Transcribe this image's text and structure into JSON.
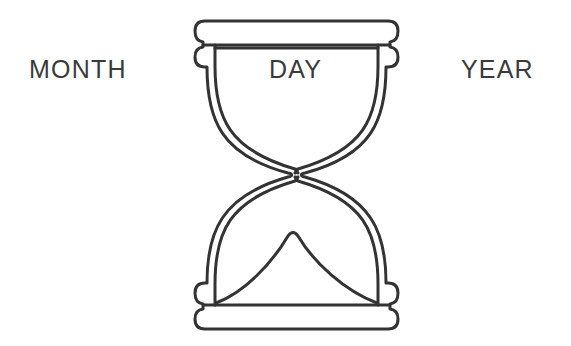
{
  "canvas": {
    "width": 571,
    "height": 346,
    "background_color": "#ffffff"
  },
  "illustration": {
    "name": "hourglass-line-drawing",
    "stroke_color": "#333333",
    "fill_color": "#ffffff",
    "stroke_width": 3
  },
  "labels": {
    "month": "MONTH",
    "day": "DAY",
    "year": "YEAR",
    "text_color": "#3a3a3a",
    "font_size": "25px"
  },
  "parts": {
    "top_cap": "top-cap-bar",
    "top_bulb": "upper-glass-bulb",
    "waist": "hourglass-waist",
    "bottom_bulb": "lower-glass-bulb",
    "sand_mound": "sand-mound",
    "bottom_cap": "bottom-cap-bar"
  }
}
